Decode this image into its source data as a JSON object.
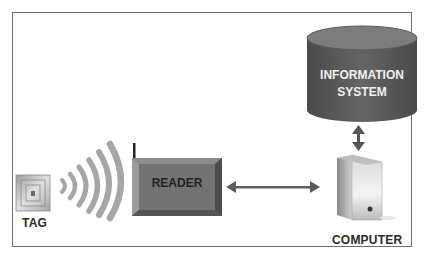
{
  "diagram": {
    "nodes": {
      "tag": {
        "label": "TAG"
      },
      "reader": {
        "label": "READER"
      },
      "computer": {
        "label": "COMPUTER"
      },
      "information_system": {
        "label_line1": "INFORMATION",
        "label_line2": "SYSTEM"
      }
    },
    "edges": [
      {
        "from": "tag",
        "to": "reader",
        "type": "wireless-waves"
      },
      {
        "from": "reader",
        "to": "computer",
        "type": "bidirectional-arrow"
      },
      {
        "from": "computer",
        "to": "information_system",
        "type": "bidirectional-arrow"
      }
    ],
    "colors": {
      "frame": "#6f6f6f",
      "reader_face": "#6e6e6e",
      "db_body": "#5a5a5a",
      "db_top": "#7a7a7a",
      "arrow": "#5c5c5c",
      "waves": "#a8a8a8"
    }
  }
}
